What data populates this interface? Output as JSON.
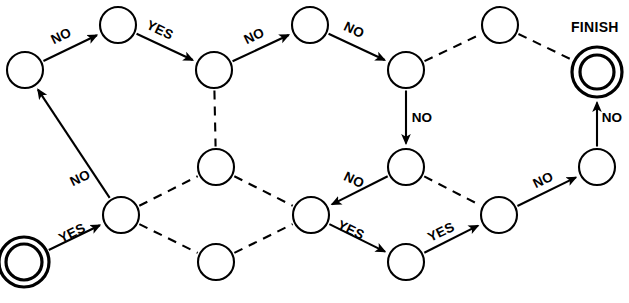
{
  "diagram": {
    "type": "state-machine-flowchart",
    "title": "",
    "canvas": {
      "width": 629,
      "height": 303
    },
    "labels": {
      "finish": "FINISH",
      "yes": "YES",
      "no": "NO"
    },
    "nodes": [
      {
        "id": "start",
        "name": "start-node",
        "cx": 24,
        "cy": 262,
        "r": 18,
        "shape": "double-circle",
        "outer_r": 25,
        "label": ""
      },
      {
        "id": "n1",
        "name": "node-1",
        "cx": 25,
        "cy": 70,
        "r": 18,
        "shape": "circle",
        "label": ""
      },
      {
        "id": "n2",
        "name": "node-2",
        "cx": 118,
        "cy": 25,
        "r": 18,
        "shape": "circle",
        "label": ""
      },
      {
        "id": "n3",
        "name": "node-3",
        "cx": 214,
        "cy": 70,
        "r": 18,
        "shape": "circle",
        "label": ""
      },
      {
        "id": "n4",
        "name": "node-4",
        "cx": 310,
        "cy": 25,
        "r": 18,
        "shape": "circle",
        "label": ""
      },
      {
        "id": "n5",
        "name": "node-5",
        "cx": 406,
        "cy": 70,
        "r": 18,
        "shape": "circle",
        "label": ""
      },
      {
        "id": "n6",
        "name": "node-6",
        "cx": 500,
        "cy": 25,
        "r": 18,
        "shape": "circle",
        "label": ""
      },
      {
        "id": "finish",
        "name": "finish-node",
        "cx": 597,
        "cy": 72,
        "r": 17,
        "shape": "double-circle",
        "outer_r": 25,
        "label": "FINISH"
      },
      {
        "id": "n7",
        "name": "node-7",
        "cx": 121,
        "cy": 215,
        "r": 18,
        "shape": "circle",
        "label": ""
      },
      {
        "id": "n8",
        "name": "node-8",
        "cx": 216,
        "cy": 167,
        "r": 18,
        "shape": "circle",
        "label": ""
      },
      {
        "id": "n9",
        "name": "node-9",
        "cx": 216,
        "cy": 262,
        "r": 18,
        "shape": "circle",
        "label": ""
      },
      {
        "id": "n10",
        "name": "node-10",
        "cx": 311,
        "cy": 215,
        "r": 18,
        "shape": "circle",
        "label": ""
      },
      {
        "id": "n11",
        "name": "node-11",
        "cx": 406,
        "cy": 167,
        "r": 18,
        "shape": "circle",
        "label": ""
      },
      {
        "id": "n12",
        "name": "node-12",
        "cx": 406,
        "cy": 262,
        "r": 18,
        "shape": "circle",
        "label": ""
      },
      {
        "id": "n13",
        "name": "node-13",
        "cx": 499,
        "cy": 215,
        "r": 18,
        "shape": "circle",
        "label": ""
      },
      {
        "id": "n14",
        "name": "node-14",
        "cx": 597,
        "cy": 167,
        "r": 18,
        "shape": "circle",
        "label": ""
      }
    ],
    "edges": [
      {
        "id": "e1",
        "name": "edge-start-to-n7",
        "from": "start",
        "to": "n7",
        "style": "solid",
        "arrow": true,
        "label": "YES",
        "label_x": 74,
        "label_y": 237,
        "label_rot": -26
      },
      {
        "id": "e2",
        "name": "edge-n7-to-n1",
        "from": "n7",
        "to": "n1",
        "style": "solid",
        "arrow": true,
        "label": "NO",
        "label_x": 82,
        "label_y": 182,
        "label_rot": -26
      },
      {
        "id": "e3",
        "name": "edge-n1-to-n2",
        "from": "n1",
        "to": "n2",
        "style": "solid",
        "arrow": true,
        "label": "NO",
        "label_x": 63,
        "label_y": 40,
        "label_rot": -26
      },
      {
        "id": "e4",
        "name": "edge-n2-to-n3",
        "from": "n2",
        "to": "n3",
        "style": "solid",
        "arrow": true,
        "label": "YES",
        "label_x": 158,
        "label_y": 34,
        "label_rot": 26
      },
      {
        "id": "e5",
        "name": "edge-n3-to-n4",
        "from": "n3",
        "to": "n4",
        "style": "solid",
        "arrow": true,
        "label": "NO",
        "label_x": 256,
        "label_y": 40,
        "label_rot": -26
      },
      {
        "id": "e6",
        "name": "edge-n4-to-n5",
        "from": "n4",
        "to": "n5",
        "style": "solid",
        "arrow": true,
        "label": "NO",
        "label_x": 352,
        "label_y": 34,
        "label_rot": 26
      },
      {
        "id": "e7",
        "name": "edge-n5-to-n6",
        "from": "n5",
        "to": "n6",
        "style": "dashed",
        "arrow": false,
        "label": "",
        "label_x": 0,
        "label_y": 0,
        "label_rot": 0
      },
      {
        "id": "e8",
        "name": "edge-n6-to-finish",
        "from": "n6",
        "to": "finish",
        "style": "dashed",
        "arrow": false,
        "label": "",
        "label_x": 0,
        "label_y": 0,
        "label_rot": 0
      },
      {
        "id": "e9",
        "name": "edge-n3-to-n8",
        "from": "n3",
        "to": "n8",
        "style": "dashed",
        "arrow": false,
        "label": "",
        "label_x": 0,
        "label_y": 0,
        "label_rot": 0
      },
      {
        "id": "e10",
        "name": "edge-n5-to-n11",
        "from": "n5",
        "to": "n11",
        "style": "solid",
        "arrow": true,
        "label": "NO",
        "label_x": 422,
        "label_y": 122,
        "label_rot": 0
      },
      {
        "id": "e11",
        "name": "edge-n7-to-n8",
        "from": "n7",
        "to": "n8",
        "style": "dashed",
        "arrow": false,
        "label": "",
        "label_x": 0,
        "label_y": 0,
        "label_rot": 0
      },
      {
        "id": "e12",
        "name": "edge-n7-to-n9",
        "from": "n7",
        "to": "n9",
        "style": "dashed",
        "arrow": false,
        "label": "",
        "label_x": 0,
        "label_y": 0,
        "label_rot": 0
      },
      {
        "id": "e13",
        "name": "edge-n8-to-n10",
        "from": "n8",
        "to": "n10",
        "style": "dashed",
        "arrow": false,
        "label": "",
        "label_x": 0,
        "label_y": 0,
        "label_rot": 0
      },
      {
        "id": "e14",
        "name": "edge-n9-to-n10",
        "from": "n9",
        "to": "n10",
        "style": "dashed",
        "arrow": false,
        "label": "",
        "label_x": 0,
        "label_y": 0,
        "label_rot": 0
      },
      {
        "id": "e15",
        "name": "edge-n11-to-n10",
        "from": "n11",
        "to": "n10",
        "style": "solid",
        "arrow": true,
        "label": "NO",
        "label_x": 352,
        "label_y": 184,
        "label_rot": 26
      },
      {
        "id": "e16",
        "name": "edge-n11-to-n13",
        "from": "n11",
        "to": "n13",
        "style": "dashed",
        "arrow": false,
        "label": "",
        "label_x": 0,
        "label_y": 0,
        "label_rot": 0
      },
      {
        "id": "e17",
        "name": "edge-n10-to-n12",
        "from": "n10",
        "to": "n12",
        "style": "solid",
        "arrow": true,
        "label": "YES",
        "label_x": 349,
        "label_y": 234,
        "label_rot": 26
      },
      {
        "id": "e18",
        "name": "edge-n12-to-n13",
        "from": "n12",
        "to": "n13",
        "style": "solid",
        "arrow": true,
        "label": "YES",
        "label_x": 443,
        "label_y": 236,
        "label_rot": -26
      },
      {
        "id": "e19",
        "name": "edge-n13-to-n14",
        "from": "n13",
        "to": "n14",
        "style": "solid",
        "arrow": true,
        "label": "NO",
        "label_x": 545,
        "label_y": 184,
        "label_rot": -26
      },
      {
        "id": "e20",
        "name": "edge-n14-to-finish",
        "from": "n14",
        "to": "finish",
        "style": "solid",
        "arrow": true,
        "label": "NO",
        "label_x": 612,
        "label_y": 122,
        "label_rot": 0
      }
    ],
    "finish_label_pos": {
      "x": 571,
      "y": 32
    }
  }
}
